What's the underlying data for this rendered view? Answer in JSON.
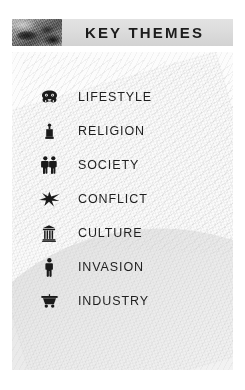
{
  "header": {
    "title": "KEY THEMES",
    "thumbnail_icon": "photo-thumbnail",
    "band_color": "#dcdcdc",
    "title_color": "#1c1c1c"
  },
  "panel": {
    "background_color": "#fcfcfc",
    "texture": "faint-diagonal-halftone"
  },
  "themes": [
    {
      "label": "LIFESTYLE",
      "icon": "mask-face-icon"
    },
    {
      "label": "RELIGION",
      "icon": "monument-pillar-icon"
    },
    {
      "label": "SOCIETY",
      "icon": "two-people-icon"
    },
    {
      "label": "CONFLICT",
      "icon": "star-burst-icon"
    },
    {
      "label": "CULTURE",
      "icon": "classical-urn-icon"
    },
    {
      "label": "INVASION",
      "icon": "standing-figure-icon"
    },
    {
      "label": "INDUSTRY",
      "icon": "mine-cart-icon"
    }
  ]
}
